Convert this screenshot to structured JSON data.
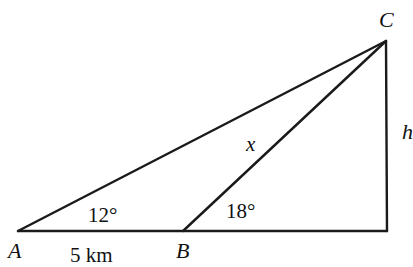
{
  "diagram": {
    "type": "triangle-geometry",
    "colors": {
      "line": "#1a1a1a",
      "text": "#111111",
      "background": "#ffffff"
    },
    "points": {
      "A": {
        "label": "A",
        "x": 18,
        "y": 231
      },
      "B": {
        "label": "B",
        "x": 183,
        "y": 231
      },
      "C": {
        "label": "C",
        "x": 386,
        "y": 41
      },
      "D": {
        "label": "",
        "x": 387,
        "y": 231
      }
    },
    "segments": [
      {
        "from": "A",
        "to": "D",
        "label": ""
      },
      {
        "from": "A",
        "to": "C",
        "label": ""
      },
      {
        "from": "B",
        "to": "C",
        "label": "x"
      },
      {
        "from": "C",
        "to": "D",
        "label": "h"
      }
    ],
    "labels": {
      "vertex_a": "A",
      "vertex_b": "B",
      "vertex_c": "C",
      "side_ab": "5 km",
      "side_bc": "x",
      "height": "h",
      "angle_a": "12°",
      "angle_b": "18°"
    }
  }
}
